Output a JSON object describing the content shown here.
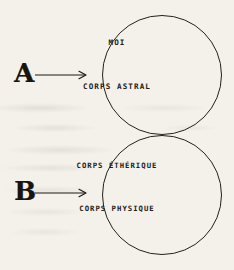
{
  "figure": {
    "background_color": "#f3f1ea",
    "ink_color": "#1d1a17",
    "markers": [
      {
        "id": "a",
        "label": "A",
        "arrow_icon": "arrow-right-icon",
        "points_to": "upper-circle"
      },
      {
        "id": "b",
        "label": "B",
        "arrow_icon": "arrow-right-icon",
        "points_to": "lower-circle"
      }
    ],
    "circles": [
      {
        "id": "upper",
        "name": "upper-circle",
        "labels": [
          "MOI",
          "CORPS ASTRAL"
        ]
      },
      {
        "id": "lower",
        "name": "lower-circle",
        "labels": [
          "CORPS ÉTHÉRIQUE",
          "CORPS PHYSIQUE"
        ]
      }
    ]
  }
}
